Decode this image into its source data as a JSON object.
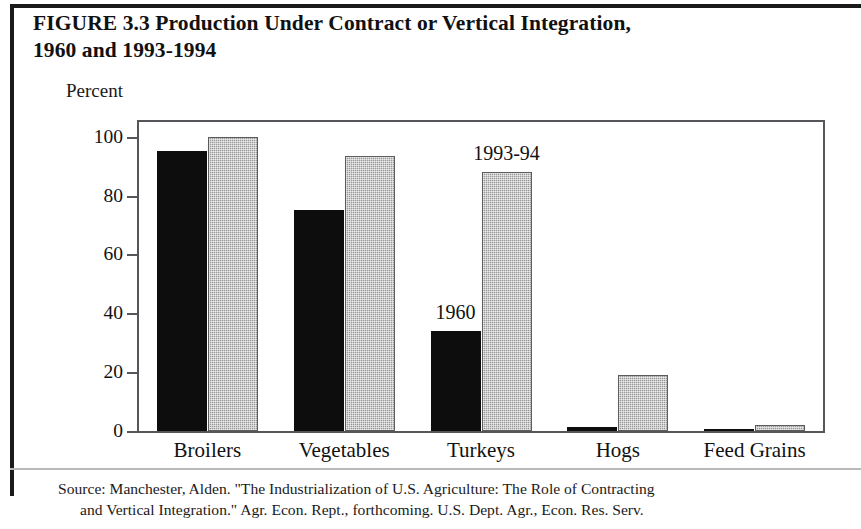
{
  "figure": {
    "title_line1": "FIGURE 3.3  Production Under Contract or Vertical Integration,",
    "title_line2": "1960 and 1993-1994",
    "unit_label": "Percent",
    "source_line1": "Source: Manchester, Alden. \"The Industrialization of U.S. Agriculture: The Role of Contracting",
    "source_line2": "and Vertical Integration.\" Agr. Econ. Rept., forthcoming. U.S. Dept. Agr., Econ. Res. Serv.",
    "annotation_1960": "1960",
    "annotation_1993": "1993-94"
  },
  "colors": {
    "series_1960": "#0d0d0d",
    "series_1993": "#9a9a9a",
    "axis": "#55555a",
    "text": "#111111",
    "background": "#ffffff"
  },
  "chart_data": {
    "type": "bar",
    "title": "FIGURE 3.3  Production Under Contract or Vertical Integration, 1960 and 1993-1994",
    "xlabel": "",
    "ylabel": "Percent",
    "ylim": [
      0,
      105
    ],
    "yticks": [
      0,
      20,
      40,
      60,
      80,
      100
    ],
    "ytick_labels": [
      "0",
      "20",
      "40",
      "60",
      "80",
      "100"
    ],
    "grid": false,
    "legend": "inline-annotations",
    "categories": [
      "Broilers",
      "Vegetables",
      "Turkeys",
      "Hogs",
      "Feed Grains"
    ],
    "series": [
      {
        "name": "1960",
        "color": "#0d0d0d",
        "values": [
          95,
          75,
          34,
          1.5,
          0
        ]
      },
      {
        "name": "1993-94",
        "color": "#9a9a9a",
        "values": [
          100,
          93.5,
          88,
          19,
          2
        ]
      }
    ],
    "annotations": [
      {
        "text": "1960",
        "series": "1960",
        "near_category": "Turkeys"
      },
      {
        "text": "1993-94",
        "series": "1993-94",
        "near_category": "Turkeys"
      }
    ]
  }
}
